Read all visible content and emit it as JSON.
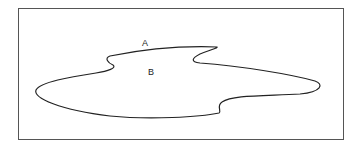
{
  "diagram": {
    "labels": {
      "outside": "A",
      "inside": "B"
    },
    "colors": {
      "stroke": "#222222",
      "frame": "#555555",
      "background": "#ffffff"
    }
  }
}
